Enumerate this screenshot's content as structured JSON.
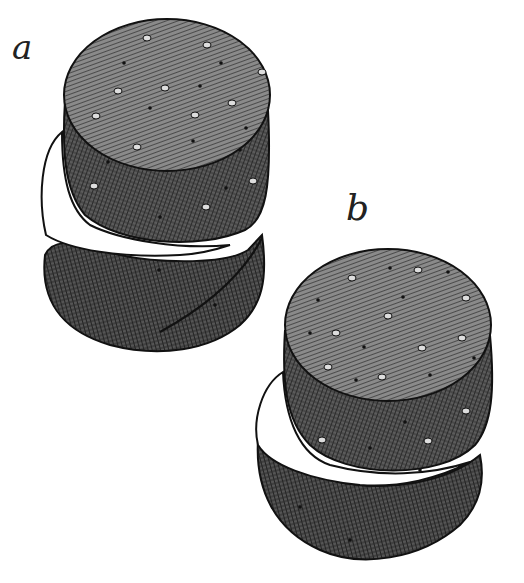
{
  "figure": {
    "panels": [
      {
        "id": "a",
        "label": "a",
        "description": "Stack of cylindrical discs, top disc with cut segment below"
      },
      {
        "id": "b",
        "label": "b",
        "description": "Two stacked cylindrical discs separated by white gap"
      }
    ],
    "colors": {
      "ink": "#1a1a1a",
      "top_face": "#7a7a7a",
      "side_face": "#4a4a4a",
      "background": "#ffffff"
    }
  }
}
